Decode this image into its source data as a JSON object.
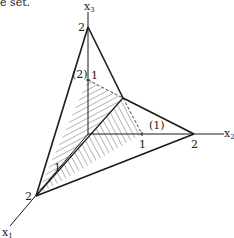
{
  "caption": "e set.",
  "axes": {
    "x1": {
      "label": "x",
      "sub": "1"
    },
    "x2": {
      "label": "x",
      "sub": "2"
    },
    "x3": {
      "label": "x",
      "sub": "3"
    }
  },
  "ticks": {
    "x3_2": "2",
    "x3_1": "1",
    "x2_1": "1",
    "x2_2": "2",
    "x1_2": "2",
    "x1_1": "1"
  },
  "constraints": {
    "c1": "(1)",
    "c2": "(2)"
  },
  "colors": {
    "line": "#1a1a1a",
    "hatch": "#333333",
    "background": "#ffffff"
  }
}
